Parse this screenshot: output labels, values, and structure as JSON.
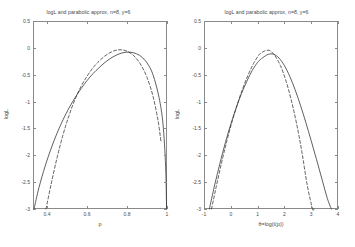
{
  "figure": {
    "width": 355,
    "height": 247,
    "background": "#ffffff",
    "axis_color": "#8a8a8a",
    "text_color": "#4a4a4a",
    "curve_color": "#2b2b2b"
  },
  "panels": [
    {
      "id": "left",
      "title": "logL and parabolic approx, n=8, y=6",
      "xlabel": "p",
      "ylabel": "logL",
      "xticklabels": [
        "0.4",
        "0.6",
        "0.8",
        "1"
      ],
      "yticklabels": [
        "0.5",
        "0",
        "-0.5",
        "-1",
        "-1.5",
        "-2",
        "-2.5",
        "-3"
      ]
    },
    {
      "id": "right",
      "title": "logL and parabolic approx, n=8, y=6",
      "xlabel": "θ=log(t(p))",
      "ylabel": "logL",
      "xticklabels": [
        "-1",
        "0",
        "1",
        "2",
        "3",
        "4"
      ],
      "yticklabels": [
        "0.5",
        "0",
        "-0.5",
        "-1",
        "-1.5",
        "-2",
        "-2.5",
        "-3"
      ]
    }
  ],
  "chart_data": [
    {
      "type": "line",
      "panel": "left",
      "title": "logL and parabolic approx, n=8, y=6",
      "xlabel": "p",
      "ylabel": "logL",
      "xlim": [
        0.33,
        1.0
      ],
      "ylim": [
        -3.0,
        0.5
      ],
      "xticks": [
        0.4,
        0.6,
        0.8,
        1.0
      ],
      "yticks": [
        0.5,
        0,
        -0.5,
        -1,
        -1.5,
        -2,
        -2.5,
        -3
      ],
      "grid": false,
      "legend": false,
      "n": 8,
      "y_successes": 6,
      "mle": 0.75,
      "series": [
        {
          "name": "logL",
          "style": "solid",
          "x": [
            0.335,
            0.36,
            0.39,
            0.42,
            0.45,
            0.48,
            0.51,
            0.54,
            0.57,
            0.6,
            0.63,
            0.66,
            0.69,
            0.72,
            0.75,
            0.78,
            0.81,
            0.84,
            0.87,
            0.9,
            0.93,
            0.96,
            0.98,
            0.993,
            0.998
          ],
          "y": [
            -3.0,
            -2.6,
            -2.21,
            -1.88,
            -1.59,
            -1.34,
            -1.12,
            -0.93,
            -0.76,
            -0.61,
            -0.48,
            -0.37,
            -0.27,
            -0.19,
            -0.13,
            -0.09,
            -0.08,
            -0.1,
            -0.16,
            -0.28,
            -0.5,
            -0.92,
            -1.42,
            -2.2,
            -3.0
          ]
        },
        {
          "name": "parabolic approx",
          "style": "dashed",
          "x": [
            0.395,
            0.42,
            0.45,
            0.48,
            0.51,
            0.54,
            0.57,
            0.6,
            0.63,
            0.66,
            0.69,
            0.72,
            0.75,
            0.78,
            0.81,
            0.84,
            0.87,
            0.9,
            0.93,
            0.955,
            0.97
          ],
          "y": [
            -3.0,
            -2.55,
            -2.05,
            -1.62,
            -1.26,
            -0.96,
            -0.72,
            -0.53,
            -0.37,
            -0.25,
            -0.15,
            -0.08,
            -0.04,
            -0.04,
            -0.08,
            -0.17,
            -0.32,
            -0.55,
            -0.9,
            -1.35,
            -1.75
          ]
        }
      ]
    },
    {
      "type": "line",
      "panel": "right",
      "title": "logL and parabolic approx, n=8, y=6",
      "xlabel": "θ=log(t(p))",
      "ylabel": "logL",
      "xlim": [
        -1.0,
        4.0
      ],
      "ylim": [
        -3.0,
        0.5
      ],
      "xticks": [
        -1,
        0,
        1,
        2,
        3,
        4
      ],
      "yticks": [
        0.5,
        0,
        -0.5,
        -1,
        -1.5,
        -2,
        -2.5,
        -3
      ],
      "grid": false,
      "legend": false,
      "n": 8,
      "y_successes": 6,
      "mle": 1.0986,
      "series": [
        {
          "name": "logL",
          "style": "solid",
          "x": [
            -0.8,
            -0.6,
            -0.4,
            -0.2,
            0.0,
            0.2,
            0.4,
            0.6,
            0.8,
            1.0,
            1.1,
            1.2,
            1.4,
            1.6,
            1.8,
            2.0,
            2.2,
            2.4,
            2.6,
            2.8,
            3.0,
            3.2,
            3.4,
            3.6,
            3.75
          ],
          "y": [
            -3.0,
            -2.55,
            -2.14,
            -1.76,
            -1.42,
            -1.12,
            -0.85,
            -0.62,
            -0.42,
            -0.27,
            -0.22,
            -0.18,
            -0.12,
            -0.12,
            -0.19,
            -0.33,
            -0.53,
            -0.78,
            -1.07,
            -1.39,
            -1.73,
            -2.08,
            -2.44,
            -2.8,
            -3.0
          ]
        },
        {
          "name": "parabolic approx",
          "style": "dashed",
          "x": [
            -0.72,
            -0.55,
            -0.35,
            -0.15,
            0.05,
            0.25,
            0.45,
            0.65,
            0.85,
            1.05,
            1.1,
            1.25,
            1.45,
            1.65,
            1.85,
            2.05,
            2.25,
            2.45,
            2.65,
            2.85,
            3.05,
            3.1
          ],
          "y": [
            -3.0,
            -2.6,
            -2.15,
            -1.74,
            -1.37,
            -1.04,
            -0.75,
            -0.5,
            -0.29,
            -0.13,
            -0.11,
            -0.06,
            -0.05,
            -0.15,
            -0.33,
            -0.6,
            -0.96,
            -1.4,
            -1.93,
            -2.55,
            -3.0,
            -3.0
          ]
        }
      ]
    }
  ]
}
